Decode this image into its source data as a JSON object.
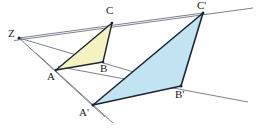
{
  "figure": {
    "type": "geometry-diagram",
    "width": 260,
    "height": 132,
    "background": "#ffffff",
    "colors": {
      "yellow_fill": "#f6f2bf",
      "blue_fill": "#c2e3f2",
      "stroke_dark": "#1a2636",
      "stroke_thin": "#6b7280",
      "label_color": "#1a1a1a"
    },
    "points": [
      {
        "name": "Z",
        "label": "Z",
        "x": 19,
        "y": 38,
        "label_x": 8,
        "label_y": 28
      },
      {
        "name": "A",
        "label": "A",
        "x": 56,
        "y": 70,
        "label_x": 48,
        "label_y": 72
      },
      {
        "name": "B",
        "label": "B",
        "x": 103,
        "y": 62,
        "label_x": 100,
        "label_y": 64
      },
      {
        "name": "C",
        "label": "C",
        "x": 112,
        "y": 23,
        "label_x": 106,
        "label_y": 6
      },
      {
        "name": "Ap",
        "label": "A'",
        "x": 93,
        "y": 105,
        "label_x": 79,
        "label_y": 108
      },
      {
        "name": "Bp",
        "label": "B'",
        "x": 181,
        "y": 86,
        "label_x": 176,
        "label_y": 90
      },
      {
        "name": "Cp",
        "label": "C'",
        "x": 203,
        "y": 13,
        "label_x": 198,
        "label_y": 1
      }
    ],
    "triangles": [
      {
        "name": "triangle-ABC",
        "vertices": "A,B,C",
        "fill": "#f6f2bf",
        "points": "56,70 103,62 112,23"
      },
      {
        "name": "triangle-ApBpCp",
        "vertices": "A',B',C'",
        "fill": "#c2e3f2",
        "points": "93,105 181,86 203,13"
      }
    ],
    "rays": [
      {
        "name": "ray-Z-A-Ap",
        "from": "Z",
        "through": "A",
        "to": "A'",
        "x1": 19,
        "y1": 38,
        "x2": 105,
        "y2": 116
      },
      {
        "name": "ray-Z-B-Bp",
        "from": "Z",
        "through": "B",
        "to": "B'",
        "x1": 19,
        "y1": 38,
        "x2": 242,
        "y2": 101
      },
      {
        "name": "ray-Z-C-Cp",
        "from": "Z",
        "through": "C",
        "to": "C'",
        "x1": 19,
        "y1": 38,
        "x2": 253,
        "y2": 8
      }
    ],
    "segments": [
      {
        "name": "line-CCp-extended",
        "x1": 14,
        "y1": 40,
        "x2": 253,
        "y2": 8
      },
      {
        "name": "line-A-Ap-extended",
        "x1": 36,
        "y1": 54,
        "x2": 112,
        "y2": 122
      },
      {
        "name": "line-B-Bp-extended",
        "x1": 60,
        "y1": 67,
        "x2": 247,
        "y2": 102
      }
    ],
    "labels": [
      "Z",
      "A",
      "B",
      "C",
      "A'",
      "B'",
      "C'"
    ]
  }
}
